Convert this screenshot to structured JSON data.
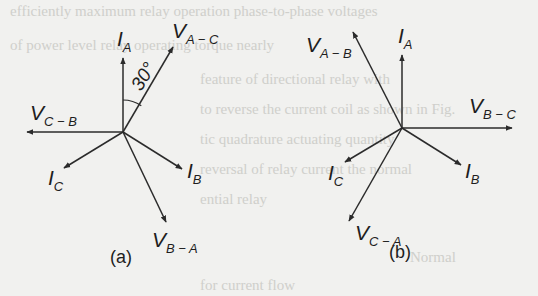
{
  "figure": {
    "panels": [
      {
        "id": "a",
        "caption": "(a)",
        "center": [
          123,
          132
        ],
        "angle_annotation": {
          "text": "30°",
          "between": [
            "I_A",
            "V_A-C"
          ]
        },
        "vectors": [
          {
            "id": "I_A",
            "main": "I",
            "sub": "A",
            "tip": [
              123,
              58
            ],
            "label_pos": [
              117,
              46
            ]
          },
          {
            "id": "V_A-C",
            "main": "V",
            "sub": "A − C",
            "tip": [
              173,
              47
            ],
            "label_pos": [
              172,
              38
            ]
          },
          {
            "id": "V_C-B",
            "main": "V",
            "sub": "C − B",
            "tip": [
              27,
              132
            ],
            "label_pos": [
              30,
              120
            ]
          },
          {
            "id": "I_C",
            "main": "I",
            "sub": "C",
            "tip": [
              64,
              168
            ],
            "label_pos": [
              48,
              185
            ]
          },
          {
            "id": "I_B",
            "main": "I",
            "sub": "B",
            "tip": [
              182,
              169
            ],
            "label_pos": [
              187,
              178
            ]
          },
          {
            "id": "V_B-A",
            "main": "V",
            "sub": "B − A",
            "tip": [
              166,
              222
            ],
            "label_pos": [
              152,
              247
            ]
          }
        ]
      },
      {
        "id": "b",
        "caption": "(b)",
        "center": [
          402,
          128
        ],
        "vectors": [
          {
            "id": "I_A",
            "main": "I",
            "sub": "A",
            "tip": [
              402,
              55
            ],
            "label_pos": [
              398,
              43
            ]
          },
          {
            "id": "V_A-B",
            "main": "V",
            "sub": "A − B",
            "tip": [
              353,
              32
            ],
            "label_pos": [
              306,
              52
            ]
          },
          {
            "id": "V_B-C",
            "main": "V",
            "sub": "B − C",
            "tip": [
              512,
              128
            ],
            "label_pos": [
              469,
              113
            ]
          },
          {
            "id": "I_C",
            "main": "I",
            "sub": "C",
            "tip": [
              345,
              162
            ],
            "label_pos": [
              328,
              180
            ]
          },
          {
            "id": "I_B",
            "main": "I",
            "sub": "B",
            "tip": [
              461,
              165
            ],
            "label_pos": [
              465,
              178
            ]
          },
          {
            "id": "V_C-A",
            "main": "V",
            "sub": "C − A",
            "tip": [
              349,
              221
            ],
            "label_pos": [
              355,
              240
            ]
          }
        ]
      }
    ]
  },
  "colors": {
    "background": "#f1f1ef",
    "ink": "#2b2b2b",
    "bleed_through": "#cfcfcb"
  }
}
